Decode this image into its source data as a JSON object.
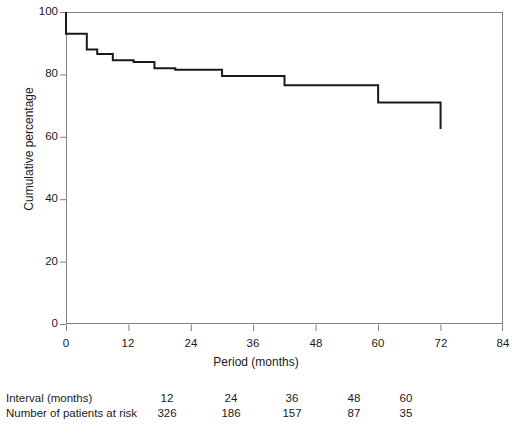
{
  "chart_data": {
    "type": "line",
    "subtype": "kaplan-meier-step",
    "title": "",
    "xlabel": "Period (months)",
    "ylabel": "Cumulative percentage",
    "xlim": [
      0,
      84
    ],
    "ylim": [
      0,
      100
    ],
    "xticks": [
      0,
      12,
      24,
      36,
      48,
      60,
      72,
      84
    ],
    "yticks": [
      0,
      20,
      40,
      60,
      80,
      100
    ],
    "grid": false,
    "legend": null,
    "line_color": "#1a1a1a",
    "series": [
      {
        "name": "Cumulative percentage",
        "step": "post",
        "x": [
          0,
          0,
          2,
          4,
          6,
          9,
          13,
          17,
          21,
          24,
          30,
          36,
          42,
          48,
          54,
          60,
          72
        ],
        "y": [
          100,
          93,
          93,
          88,
          86.5,
          84.5,
          84,
          82,
          81.5,
          81.5,
          79.5,
          79.5,
          76.5,
          76.5,
          76.5,
          71,
          62.5
        ],
        "values_note": "Step-function survival curve; drops occur at each x, flat between"
      }
    ]
  },
  "axes": {
    "y_tick_labels": [
      "100",
      "80",
      "60",
      "40",
      "20",
      "0"
    ],
    "x_tick_labels": [
      "0",
      "12",
      "24",
      "36",
      "48",
      "60",
      "72",
      "84"
    ],
    "y_axis_title": "Cumulative percentage",
    "x_axis_title": "Period (months)"
  },
  "risk_table": {
    "rows": [
      {
        "label": "Interval (months)",
        "values": [
          "12",
          "24",
          "36",
          "48",
          "60"
        ]
      },
      {
        "label": "Number of patients at risk",
        "values": [
          "326",
          "186",
          "157",
          "87",
          "35"
        ]
      }
    ]
  }
}
